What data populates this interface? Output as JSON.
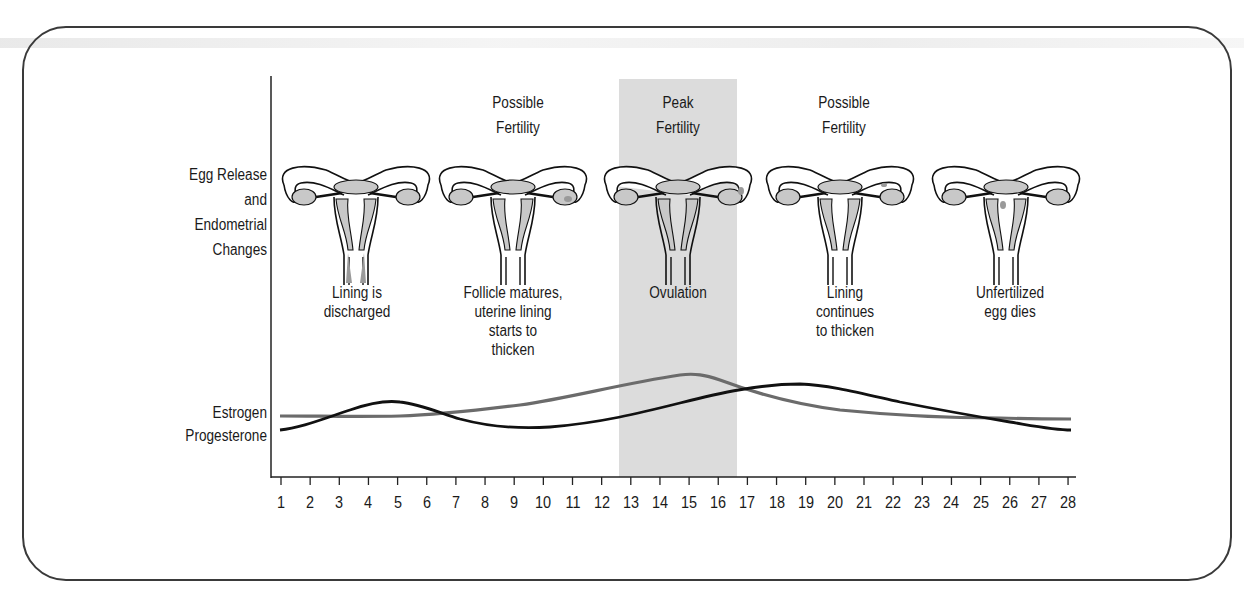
{
  "row_labels": {
    "egg_release": [
      "Egg Release",
      "and",
      "Endometrial",
      "Changes"
    ],
    "estrogen": "Estrogen",
    "progesterone": "Progesterone"
  },
  "fertility_labels": [
    {
      "line1": "Possible",
      "line2": "Fertility"
    },
    {
      "line1": "Peak",
      "line2": "Fertility"
    },
    {
      "line1": "Possible",
      "line2": "Fertility"
    }
  ],
  "stages": [
    {
      "name": "stage-1",
      "caption": [
        "Lining is",
        "discharged"
      ]
    },
    {
      "name": "stage-2",
      "caption": [
        "Follicle matures,",
        "uterine lining",
        "starts to",
        "thicken"
      ]
    },
    {
      "name": "stage-3",
      "caption": [
        "Ovulation"
      ]
    },
    {
      "name": "stage-4",
      "caption": [
        "Lining",
        "continues",
        "to thicken"
      ]
    },
    {
      "name": "stage-5",
      "caption": [
        "Unfertilized",
        "egg dies"
      ]
    }
  ],
  "colors": {
    "estrogen": "#6b6b6b",
    "progesterone": "#111111",
    "peak_band": "#dcdcdc",
    "uterus_fill": "#c8c8c8",
    "uterus_dark": "#9a9a9a"
  },
  "chart_data": {
    "type": "line",
    "title": "",
    "xlabel": "Day of cycle",
    "ylabel": "",
    "x": [
      1,
      2,
      3,
      4,
      5,
      6,
      7,
      8,
      9,
      10,
      11,
      12,
      13,
      14,
      15,
      16,
      17,
      18,
      19,
      20,
      21,
      22,
      23,
      24,
      25,
      26,
      27,
      28
    ],
    "xlim": [
      1,
      28
    ],
    "grid": false,
    "shaded_region": {
      "label": "Peak Fertility",
      "x_start": 12.5,
      "x_end": 16.5
    },
    "series": [
      {
        "name": "Estrogen",
        "color": "#6b6b6b",
        "values": [
          20,
          20.5,
          21,
          21,
          21,
          21.5,
          23,
          25,
          27,
          30,
          34,
          38,
          43,
          49,
          54,
          52,
          43,
          34,
          27,
          22,
          19,
          17,
          16,
          15.5,
          15,
          14.5,
          14.5,
          14.5
        ]
      },
      {
        "name": "Progesterone",
        "color": "#111111",
        "values": [
          8,
          12,
          20,
          26,
          27,
          24,
          18,
          13,
          10,
          9,
          9.5,
          11,
          14,
          18,
          22,
          27,
          32,
          37,
          40,
          39,
          35,
          30,
          25,
          20,
          16,
          12,
          9,
          8
        ]
      }
    ],
    "annotations": [
      "Lining is discharged",
      "Follicle matures, uterine lining starts to thicken",
      "Ovulation",
      "Lining continues to thicken",
      "Unfertilized egg dies"
    ]
  }
}
